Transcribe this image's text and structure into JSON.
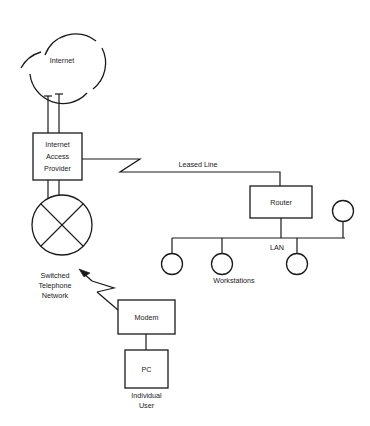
{
  "diagram": {
    "line_color": "#1a1a1a",
    "background_color": "#ffffff",
    "nodes": {
      "internet_cloud": {
        "label": "Internet"
      },
      "internet_access_provider": {
        "line1": "Internet",
        "line2": "Access",
        "line3": "Provider"
      },
      "switched_telephone_network": {
        "line1": "Switched",
        "line2": "Telephone",
        "line3": "Network"
      },
      "router": {
        "label": "Router"
      },
      "modem": {
        "label": "Modem"
      },
      "pc": {
        "label": "PC"
      }
    },
    "links": {
      "leased_line": {
        "label": "Leased Line"
      },
      "lan_bus": {
        "label": "LAN"
      }
    },
    "captions": {
      "workstations": "Workstations",
      "individual_user_line1": "Individual",
      "individual_user_line2": "User"
    },
    "workstation_count": 4
  }
}
